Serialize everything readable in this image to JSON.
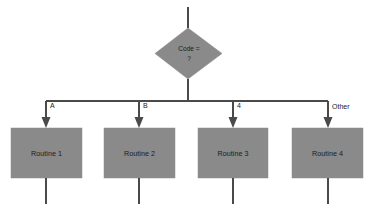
{
  "diagram": {
    "type": "flowchart",
    "colors": {
      "node_fill": "#8a8a8a",
      "line": "#4a4a4a",
      "text": "#1b1b1b",
      "background": "#ffffff"
    },
    "decision": {
      "shape": "diamond",
      "line1": "Code =",
      "line2": "?"
    },
    "branches": [
      {
        "label": "A",
        "routine": "Routine 1"
      },
      {
        "label": "B",
        "routine": "Routine 2"
      },
      {
        "label": "4",
        "routine": "Routine 3"
      },
      {
        "label": "Other",
        "routine": "Routine 4"
      }
    ]
  }
}
